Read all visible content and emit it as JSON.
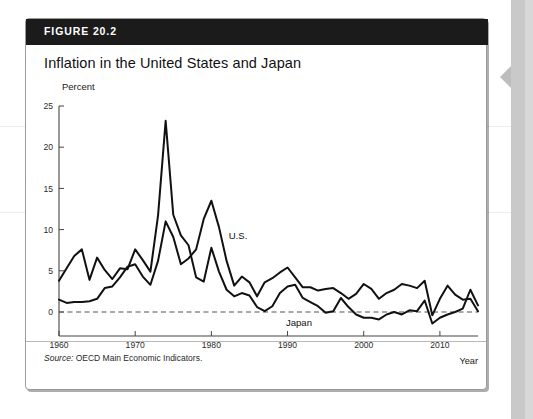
{
  "figure": {
    "number_label": "FIGURE 20.2",
    "title": "Inflation in the United States and Japan",
    "source_prefix": "Source:",
    "source_text": " OECD Main Economic Indicators."
  },
  "colors": {
    "header_bg": "#1b1b1b",
    "line": "#111111",
    "zero_line": "#555555",
    "axis": "#444444",
    "card_border": "#9a9a9a",
    "page_edge": "#c9c9c9"
  },
  "chart_data": {
    "type": "line",
    "title": "Inflation in the United States and Japan",
    "subtitle": "",
    "xlabel": "Year",
    "ylabel": "Percent",
    "ylim": [
      -3,
      25
    ],
    "xlim": [
      1960,
      2015
    ],
    "yticks": [
      0,
      5,
      10,
      15,
      20,
      25
    ],
    "ytick_labels": [
      "0",
      "5",
      "10",
      "15",
      "20",
      "25"
    ],
    "xticks": [
      1960,
      1970,
      1980,
      1990,
      2000,
      2010
    ],
    "xtick_labels": [
      "1960",
      "1970",
      "1980",
      "1990",
      "2000",
      "2010"
    ],
    "grid": false,
    "legend": "inline-annotations",
    "annotations": [
      {
        "text": "U.S.",
        "x": 1983.5,
        "y": 8.9
      },
      {
        "text": "Japan",
        "x": 1991.5,
        "y": -1.7
      }
    ],
    "zero_reference_line": 0,
    "x": [
      1960,
      1961,
      1962,
      1963,
      1964,
      1965,
      1966,
      1967,
      1968,
      1969,
      1970,
      1971,
      1972,
      1973,
      1974,
      1975,
      1976,
      1977,
      1978,
      1979,
      1980,
      1981,
      1982,
      1983,
      1984,
      1985,
      1986,
      1987,
      1988,
      1989,
      1990,
      1991,
      1992,
      1993,
      1994,
      1995,
      1996,
      1997,
      1998,
      1999,
      2000,
      2001,
      2002,
      2003,
      2004,
      2005,
      2006,
      2007,
      2008,
      2009,
      2010,
      2011,
      2012,
      2013,
      2014,
      2015
    ],
    "series": [
      {
        "name": "Japan",
        "values": [
          3.8,
          5.3,
          6.8,
          7.6,
          3.9,
          6.6,
          5.1,
          4.0,
          5.3,
          5.2,
          7.6,
          6.3,
          4.9,
          11.7,
          23.2,
          11.8,
          9.3,
          8.1,
          4.2,
          3.7,
          7.8,
          4.9,
          2.7,
          1.9,
          2.3,
          2.0,
          0.6,
          0.1,
          0.7,
          2.3,
          3.1,
          3.3,
          1.7,
          1.2,
          0.7,
          -0.1,
          0.1,
          1.7,
          0.6,
          -0.3,
          -0.7,
          -0.7,
          -0.9,
          -0.3,
          0.0,
          -0.3,
          0.2,
          0.1,
          1.4,
          -1.4,
          -0.7,
          -0.3,
          0.0,
          0.4,
          2.7,
          0.8
        ]
      },
      {
        "name": "U.S.",
        "values": [
          1.5,
          1.1,
          1.2,
          1.2,
          1.3,
          1.6,
          2.9,
          3.1,
          4.2,
          5.5,
          5.8,
          4.3,
          3.3,
          6.2,
          11.0,
          9.1,
          5.8,
          6.5,
          7.6,
          11.3,
          13.5,
          10.3,
          6.2,
          3.2,
          4.3,
          3.6,
          1.9,
          3.6,
          4.1,
          4.8,
          5.4,
          4.2,
          3.0,
          3.0,
          2.6,
          2.8,
          2.9,
          2.3,
          1.6,
          2.2,
          3.4,
          2.8,
          1.6,
          2.3,
          2.7,
          3.4,
          3.2,
          2.9,
          3.8,
          -0.4,
          1.6,
          3.2,
          2.1,
          1.5,
          1.6,
          0.1
        ]
      }
    ]
  }
}
